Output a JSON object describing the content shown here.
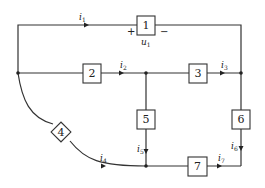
{
  "diagram": {
    "type": "circuit-graph",
    "elements": [
      {
        "id": "1",
        "label": "1",
        "shape": "square"
      },
      {
        "id": "2",
        "label": "2",
        "shape": "square"
      },
      {
        "id": "3",
        "label": "3",
        "shape": "square"
      },
      {
        "id": "4",
        "label": "4",
        "shape": "diamond"
      },
      {
        "id": "5",
        "label": "5",
        "shape": "square"
      },
      {
        "id": "6",
        "label": "6",
        "shape": "square"
      },
      {
        "id": "7",
        "label": "7",
        "shape": "square"
      }
    ],
    "currents": {
      "i1": {
        "base": "i",
        "sub": "1"
      },
      "i2": {
        "base": "i",
        "sub": "2"
      },
      "i3": {
        "base": "i",
        "sub": "3"
      },
      "i4": {
        "base": "i",
        "sub": "4"
      },
      "i5": {
        "base": "i",
        "sub": "5"
      },
      "i6": {
        "base": "i",
        "sub": "6"
      },
      "i7": {
        "base": "i",
        "sub": "7"
      }
    },
    "voltage": {
      "base": "u",
      "sub": "1",
      "plus": "+",
      "minus": "−"
    }
  }
}
